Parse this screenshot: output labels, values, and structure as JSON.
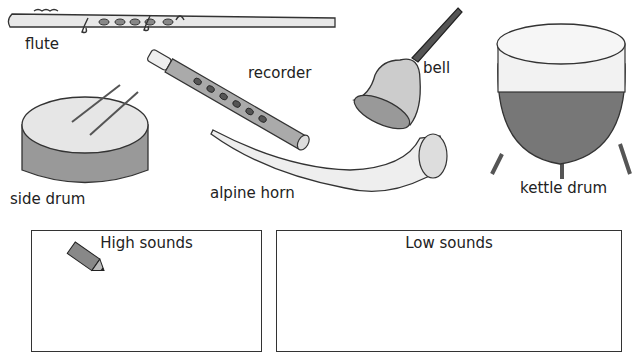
{
  "instruments": [
    {
      "id": "flute",
      "label": "flute"
    },
    {
      "id": "recorder",
      "label": "recorder"
    },
    {
      "id": "bell",
      "label": "bell"
    },
    {
      "id": "kettle-drum",
      "label": "kettle drum"
    },
    {
      "id": "side-drum",
      "label": "side drum"
    },
    {
      "id": "alpine-horn",
      "label": "alpine horn"
    }
  ],
  "sort_boxes": [
    {
      "id": "high",
      "title": "High sounds",
      "icon": "pencil-icon"
    },
    {
      "id": "low",
      "title": "Low sounds"
    }
  ]
}
